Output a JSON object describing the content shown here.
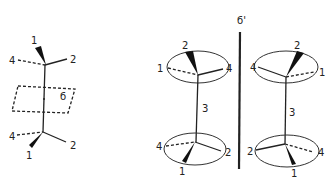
{
  "figure": {
    "left_molecule": {
      "upper_labels": {
        "top": "1",
        "left": "4",
        "right": "2"
      },
      "lower_labels": {
        "bottom": "1",
        "left": "4",
        "right": "2"
      },
      "plane_label": "б"
    },
    "mirror_label": "б'",
    "middle_molecule": {
      "upper_labels": {
        "top": "2",
        "left": "1",
        "right": "4"
      },
      "bond_label": "3",
      "lower_labels": {
        "bottom": "1",
        "left": "4",
        "right": "2"
      }
    },
    "right_molecule": {
      "upper_labels": {
        "top": "2",
        "left": "4",
        "right": "1"
      },
      "bond_label": "3",
      "lower_labels": {
        "bottom": "1",
        "left": "2",
        "right": "4"
      }
    }
  }
}
